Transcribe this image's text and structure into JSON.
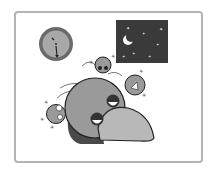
{
  "illustration": {
    "description": "Cartoon of a sleepy gray bird with dream bubbles/small worried creatures around its head, a wall clock and a night sky window",
    "elements": [
      "frame",
      "wall-clock",
      "night-window",
      "moon",
      "stars",
      "sleepy-bird",
      "small-worry-creatures"
    ],
    "colors": {
      "frame": "#b4b4b4",
      "night_sky": "#3a3a3a",
      "bird_body": "#9a9a9a",
      "bird_beak": "#b8b8b8",
      "bird_shadow": "#4a4a4a",
      "clock_rim": "#6a6a6a",
      "clock_face": "#a8a8a8"
    }
  }
}
